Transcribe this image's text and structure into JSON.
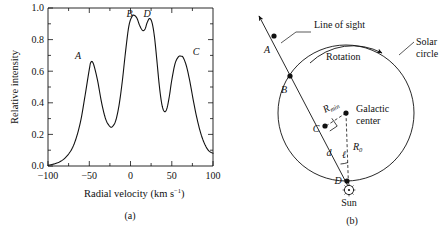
{
  "figure": {
    "panels": [
      {
        "id": "a",
        "caption": "(a)"
      },
      {
        "id": "b",
        "caption": "(b)"
      }
    ]
  },
  "chart_data": {
    "type": "line",
    "title": "",
    "xlabel": "Radial velocity (km s−1)",
    "xlabel_main": "Radial velocity (km s",
    "xlabel_exp": "−1",
    "xlabel_tail": ")",
    "ylabel": "Relative intensity",
    "xlim": [
      -100,
      100
    ],
    "ylim": [
      0.0,
      1.05
    ],
    "xticks": [
      -100,
      -50,
      0,
      50,
      100
    ],
    "xticklabels": [
      "−100",
      "−50",
      "0",
      "50",
      "100"
    ],
    "yticks": [
      0.0,
      0.2,
      0.4,
      0.6,
      0.8,
      1.0
    ],
    "yticklabels": [
      "0.0",
      "0.2",
      "0.4",
      "0.6",
      "0.8",
      "1.0"
    ],
    "grid": false,
    "legend": null,
    "annotations": [
      {
        "label": "A",
        "x": -48,
        "y": 0.69
      },
      {
        "label": "B",
        "x": 5,
        "y": 1.0
      },
      {
        "label": "D",
        "x": 23,
        "y": 0.98
      },
      {
        "label": "C",
        "x": 61,
        "y": 0.73
      }
    ],
    "peaks": [
      {
        "name": "A",
        "center": -48,
        "height": 0.69,
        "width": 16
      },
      {
        "name": "B",
        "center": 5,
        "height": 1.0,
        "width": 11
      },
      {
        "name": "D",
        "center": 23,
        "height": 0.98,
        "width": 10
      },
      {
        "name": "C",
        "center": 61,
        "height": 0.73,
        "width": 15
      }
    ],
    "series": [
      {
        "name": "21-cm line profile",
        "x": [
          -100,
          -95,
          -90,
          -85,
          -80,
          -75,
          -70,
          -65,
          -60,
          -55,
          -50,
          -48,
          -45,
          -40,
          -35,
          -30,
          -25,
          -22,
          -18,
          -14,
          -10,
          -6,
          -2,
          2,
          5,
          8,
          11,
          14,
          16,
          18,
          20,
          23,
          26,
          29,
          32,
          35,
          38,
          41,
          44,
          47,
          50,
          54,
          58,
          61,
          64,
          68,
          72,
          76,
          80,
          85,
          90,
          95,
          100
        ],
        "y": [
          0.005,
          0.01,
          0.018,
          0.03,
          0.05,
          0.08,
          0.125,
          0.2,
          0.31,
          0.47,
          0.64,
          0.69,
          0.68,
          0.57,
          0.42,
          0.31,
          0.263,
          0.262,
          0.3,
          0.4,
          0.56,
          0.76,
          0.93,
          0.995,
          1.0,
          0.98,
          0.935,
          0.905,
          0.9,
          0.915,
          0.95,
          0.98,
          0.955,
          0.86,
          0.7,
          0.53,
          0.41,
          0.362,
          0.38,
          0.46,
          0.57,
          0.68,
          0.725,
          0.73,
          0.72,
          0.66,
          0.56,
          0.44,
          0.33,
          0.22,
          0.145,
          0.1,
          0.085
        ]
      }
    ]
  },
  "diagram": {
    "labels": {
      "line_of_sight": "Line of sight",
      "rotation": "Rotation",
      "solar_circle_line1": "Solar",
      "solar_circle_line2": "circle",
      "galactic_center_line1": "Galactic",
      "galactic_center_line2": "center",
      "sun": "Sun",
      "point_a": "A",
      "point_b": "B",
      "point_c": "C",
      "point_d": "D",
      "r_min_base": "R",
      "r_min_sub": "min",
      "r_zero_base": "R",
      "r_zero_sub": "0",
      "distance_d": "d",
      "galactic_longitude": "ℓ"
    },
    "points": [
      {
        "name": "A",
        "x": 274,
        "y": 36
      },
      {
        "name": "B",
        "x": 290,
        "y": 76
      },
      {
        "name": "C",
        "x": 325,
        "y": 126
      },
      {
        "name": "D",
        "x": 347,
        "y": 181
      }
    ],
    "circle": {
      "cx": 346,
      "cy": 113,
      "r": 68
    },
    "sun": {
      "x": 349,
      "y": 190
    },
    "galactic_center": {
      "x": 346,
      "y": 113
    }
  }
}
